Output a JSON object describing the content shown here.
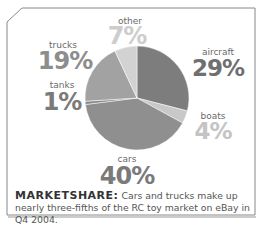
{
  "chart_data": {
    "type": "pie",
    "title": "",
    "slices": [
      {
        "label": "aircraft",
        "value": 29,
        "display": "29%",
        "color": "#7d7d7d",
        "text_color": "#6f6f6f"
      },
      {
        "label": "boats",
        "value": 4,
        "display": "4%",
        "color": "#c8c8c8",
        "text_color": "#c4c4c4"
      },
      {
        "label": "cars",
        "value": 40,
        "display": "40%",
        "color": "#8f8f8f",
        "text_color": "#7a7a7a"
      },
      {
        "label": "tanks",
        "value": 1,
        "display": "1%",
        "color": "#8a8a8a",
        "text_color": "#7a7a7a"
      },
      {
        "label": "trucks",
        "value": 19,
        "display": "19%",
        "color": "#a2a2a2",
        "text_color": "#8d8d8d"
      },
      {
        "label": "other",
        "value": 7,
        "display": "7%",
        "color": "#d2d2d2",
        "text_color": "#cdcdcd"
      }
    ],
    "start": "12 o'clock",
    "direction": "clockwise"
  },
  "caption": {
    "head": "MARKETSHARE:",
    "body": " Cars and trucks make up nearly three-fifths of the RC toy market on eBay in Q4 2004."
  }
}
